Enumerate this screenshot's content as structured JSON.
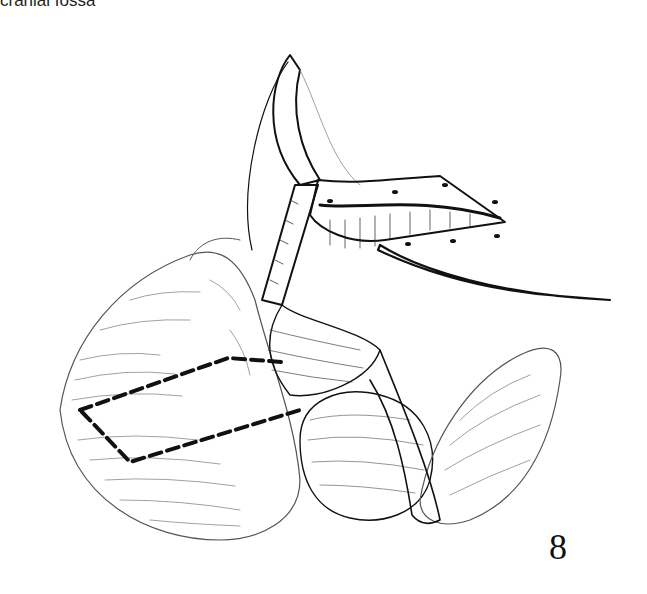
{
  "page": {
    "caption_fragment": "cranial fossa",
    "figure_number": "8"
  },
  "illustration": {
    "subject": "surgical-anatomy-line-drawing",
    "description": "Surgical line illustration of an opened cranial region with bone flap reflected, retracted dura, exposed brain surfaces and a dashed outline marking an incision region",
    "stroke_color": "#111111",
    "background_color": "#ffffff"
  }
}
